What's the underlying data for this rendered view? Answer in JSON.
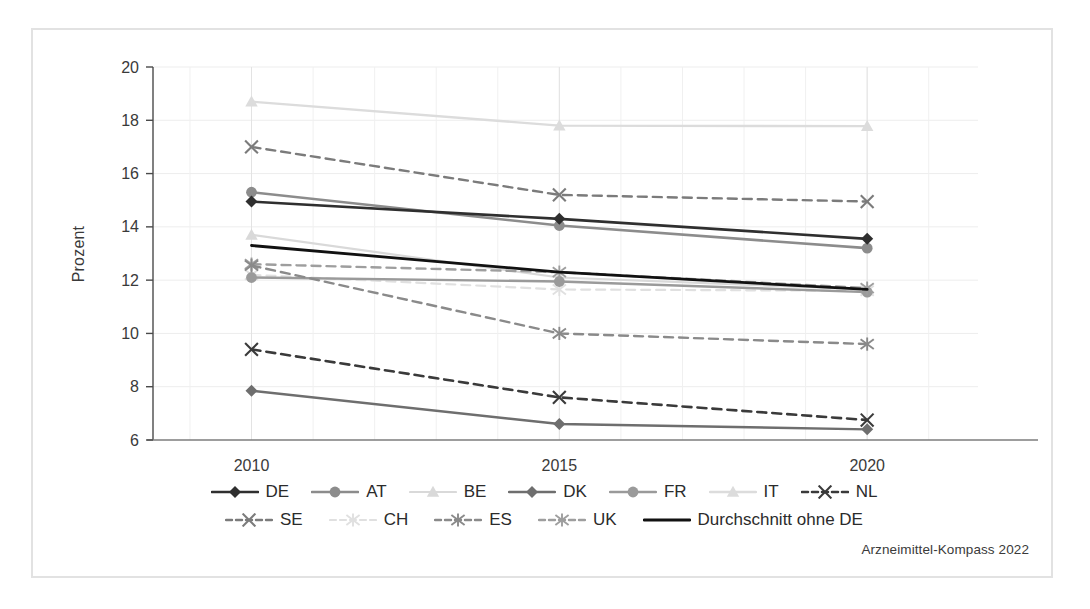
{
  "figure": {
    "source_note": "Arzneimittel-Kompass 2022",
    "frame_color": "#e2e2e2",
    "background": "#ffffff"
  },
  "chart_data": {
    "type": "line",
    "title": "",
    "xlabel": "",
    "ylabel": "Prozent",
    "x": [
      2010,
      2015,
      2020
    ],
    "xticklabels": [
      "2010",
      "2015",
      "2020"
    ],
    "yticklabels": [
      "6",
      "8",
      "10",
      "12",
      "14",
      "16",
      "18",
      "20"
    ],
    "yticks": [
      6,
      8,
      10,
      12,
      14,
      16,
      18,
      20
    ],
    "ylim": [
      6,
      20
    ],
    "xlim": [
      2008.4,
      2021.8
    ],
    "grid": true,
    "legend_position": "bottom",
    "series": [
      {
        "name": "DE",
        "label": "DE",
        "values": [
          14.95,
          14.3,
          13.55
        ],
        "color": "#2f2f2f",
        "dash": "solid",
        "marker": "diamond",
        "width": 2.6
      },
      {
        "name": "AT",
        "label": "AT",
        "values": [
          15.3,
          14.05,
          13.2
        ],
        "color": "#8c8c8c",
        "dash": "solid",
        "marker": "circle",
        "width": 2.6
      },
      {
        "name": "BE",
        "label": "BE",
        "values": [
          13.7,
          12.1,
          11.65
        ],
        "color": "#d9d9d9",
        "dash": "solid",
        "marker": "triangle",
        "width": 2.2
      },
      {
        "name": "DK",
        "label": "DK",
        "values": [
          7.85,
          6.6,
          6.4
        ],
        "color": "#6e6e6e",
        "dash": "solid",
        "marker": "diamond",
        "width": 2.4
      },
      {
        "name": "FR",
        "label": "FR",
        "values": [
          12.1,
          11.95,
          11.55
        ],
        "color": "#9a9a9a",
        "dash": "solid",
        "marker": "circle",
        "width": 2.4
      },
      {
        "name": "IT",
        "label": "IT",
        "values": [
          18.7,
          17.8,
          17.78
        ],
        "color": "#dcdcdc",
        "dash": "solid",
        "marker": "triangle",
        "width": 2.4
      },
      {
        "name": "NL",
        "label": "NL",
        "values": [
          9.4,
          7.6,
          6.75
        ],
        "color": "#3a3a3a",
        "dash": "dashed",
        "marker": "x",
        "width": 2.6
      },
      {
        "name": "SE",
        "label": "SE",
        "values": [
          17.0,
          15.2,
          14.95
        ],
        "color": "#7b7b7b",
        "dash": "dashed",
        "marker": "x",
        "width": 2.4
      },
      {
        "name": "CH",
        "label": "CH",
        "values": [
          12.2,
          11.65,
          11.6
        ],
        "color": "#e0e0e0",
        "dash": "dashed",
        "marker": "asterisk",
        "width": 2.2
      },
      {
        "name": "ES",
        "label": "ES",
        "values": [
          12.55,
          10.0,
          9.6
        ],
        "color": "#8a8a8a",
        "dash": "dashed",
        "marker": "asterisk",
        "width": 2.4
      },
      {
        "name": "UK",
        "label": "UK",
        "values": [
          12.6,
          12.3,
          11.7
        ],
        "color": "#9e9e9e",
        "dash": "dashed",
        "marker": "asterisk",
        "width": 2.4
      },
      {
        "name": "Durchschnitt ohne DE",
        "label": "Durchschnitt ohne DE",
        "values": [
          13.3,
          12.3,
          11.65
        ],
        "color": "#111111",
        "dash": "solid",
        "marker": "none",
        "width": 2.8
      }
    ]
  },
  "legend": {
    "rows": [
      [
        "DE",
        "AT",
        "BE",
        "DK",
        "FR",
        "IT",
        "NL"
      ],
      [
        "SE",
        "CH",
        "ES",
        "UK",
        "Durchschnitt ohne DE"
      ]
    ]
  }
}
